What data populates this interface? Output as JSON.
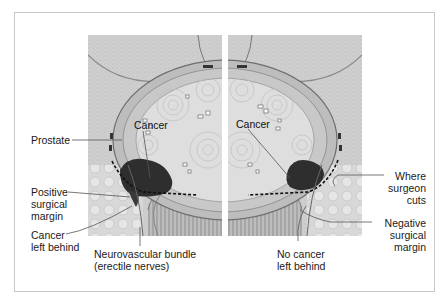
{
  "figure": {
    "left_panel": {
      "description": "positive surgical margin",
      "inner_label": "Cancer",
      "labels": {
        "prostate": "Prostate",
        "positive_margin": "Positive\nsurgical\nmargin",
        "cancer_left": "Cancer\nleft behind",
        "nerve_bundle": "Neurovascular bundle\n(erectile nerves)"
      }
    },
    "right_panel": {
      "description": "negative surgical margin",
      "inner_label": "Cancer",
      "labels": {
        "where_cuts": "Where\nsurgeon\ncuts",
        "negative_margin": "Negative\nsurgical\nmargin",
        "no_cancer_left": "No cancer\nleft behind"
      }
    },
    "colors": {
      "frame_border": "#c8c8c8",
      "tissue_bg": "#c9c9c9",
      "prostate_fill": "#dcdcdc",
      "tumor": "#2e2e2e",
      "leader_line": "#555555",
      "text": "#1a1a1a"
    }
  }
}
